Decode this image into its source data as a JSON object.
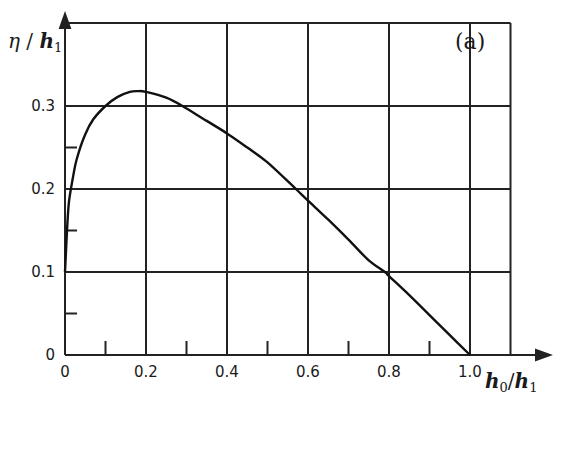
{
  "chart_data": {
    "type": "line",
    "title": "",
    "panel_label": "(a)",
    "xlabel": "h0/h1",
    "ylabel": "η/h1",
    "xlim": [
      0,
      1.2
    ],
    "ylim": [
      0,
      0.4
    ],
    "grid": true,
    "x_ticks": [
      0,
      0.2,
      0.4,
      0.6,
      0.8,
      1.0
    ],
    "x_tick_labels": [
      "0",
      "0.2",
      "0.4",
      "0.6",
      "0.8",
      "1.0"
    ],
    "y_ticks": [
      0,
      0.1,
      0.2,
      0.3
    ],
    "y_tick_labels": [
      "0",
      "0.1",
      "0.2",
      "0.3"
    ],
    "x_minor_ticks": [
      0.1,
      0.3,
      0.5,
      0.7,
      0.9
    ],
    "y_minor_ticks": [
      0.05,
      0.15,
      0.25
    ],
    "x_gridlines": [
      0.2,
      0.4,
      0.6,
      0.8,
      1.0,
      1.1
    ],
    "y_gridlines": [
      0.1,
      0.2,
      0.3,
      0.4
    ],
    "series": [
      {
        "name": "η/h1 vs h0/h1",
        "x": [
          0.0,
          0.005,
          0.01,
          0.02,
          0.03,
          0.05,
          0.07,
          0.1,
          0.13,
          0.16,
          0.18,
          0.2,
          0.25,
          0.29,
          0.35,
          0.4,
          0.45,
          0.5,
          0.57,
          0.6,
          0.65,
          0.7,
          0.75,
          0.79,
          0.8,
          0.85,
          0.9,
          0.95,
          1.0
        ],
        "values": [
          0.1,
          0.15,
          0.185,
          0.215,
          0.238,
          0.266,
          0.284,
          0.3,
          0.311,
          0.317,
          0.318,
          0.317,
          0.31,
          0.3,
          0.282,
          0.267,
          0.25,
          0.232,
          0.2,
          0.186,
          0.163,
          0.139,
          0.114,
          0.1,
          0.095,
          0.072,
          0.048,
          0.024,
          0.0
        ]
      }
    ]
  }
}
